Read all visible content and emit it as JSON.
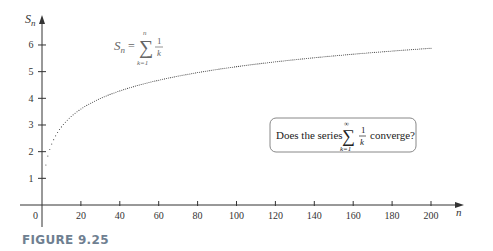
{
  "chart_data": {
    "type": "scatter",
    "title": "",
    "xlabel": "n",
    "ylabel": "S_n",
    "xlim": [
      0,
      210
    ],
    "ylim": [
      0,
      7
    ],
    "x_ticks": [
      0,
      20,
      40,
      60,
      80,
      100,
      120,
      140,
      160,
      180,
      200
    ],
    "y_ticks": [
      1,
      2,
      3,
      4,
      5,
      6
    ],
    "grid": false,
    "legend": null,
    "series": [
      {
        "name": "S_n = sum_{k=1}^{n} 1/k",
        "style": "dotted",
        "x": [
          1,
          2,
          3,
          4,
          5,
          10,
          20,
          30,
          40,
          50,
          60,
          80,
          100,
          120,
          140,
          160,
          180,
          200
        ],
        "y": [
          1.0,
          1.5,
          1.83,
          2.08,
          2.28,
          2.93,
          3.6,
          3.99,
          4.28,
          4.5,
          4.68,
          4.97,
          5.19,
          5.37,
          5.52,
          5.66,
          5.77,
          5.88
        ]
      }
    ],
    "annotations": [
      {
        "text": "S_n = Σ_{k=1}^{n} 1/k",
        "position": "upper-left"
      },
      {
        "text": "Does the series Σ_{k=1}^{∞} 1/k converge?",
        "position": "boxed, middle-right"
      }
    ]
  },
  "figure": {
    "caption": "FIGURE 9.25",
    "formula": {
      "lhs": "S",
      "lhs_sub": "n",
      "eq": "=",
      "sigma": "∑",
      "upper": "n",
      "lower": "k=1",
      "num": "1",
      "den": "k"
    },
    "question": {
      "prefix": "Does the series",
      "sigma": "∑",
      "upper": "∞",
      "lower": "k=1",
      "num": "1",
      "den": "k",
      "suffix": "converge?"
    },
    "axes": {
      "x_label": "n",
      "y_label": "S",
      "y_label_sub": "n",
      "x_tick_labels": [
        "20",
        "40",
        "60",
        "80",
        "100",
        "120",
        "140",
        "160",
        "180",
        "200"
      ],
      "y_tick_labels": [
        "1",
        "2",
        "3",
        "4",
        "5",
        "6"
      ],
      "origin_label": "0"
    }
  }
}
